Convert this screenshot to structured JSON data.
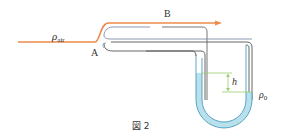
{
  "figure": {
    "caption": "図 2",
    "labels": {
      "air_density": "ρ",
      "air_density_sub": "air",
      "point_a": "A",
      "point_b": "B",
      "height": "h",
      "liquid_density": "ρ",
      "liquid_density_sub": "0"
    },
    "colors": {
      "airflow": "#ee8a4a",
      "tube": "#555555",
      "inner_tube": "#7a8fa8",
      "liquid": "#b8e1ec",
      "liquid_edge": "#4a9bbf",
      "height_marker": "#9acd6a"
    }
  }
}
